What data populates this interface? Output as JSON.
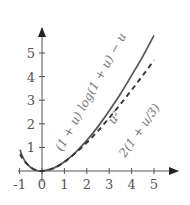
{
  "chart_data": {
    "type": "line",
    "title": "",
    "xlabel": "",
    "ylabel": "",
    "xlim": [
      -1,
      5.6
    ],
    "ylim": [
      0,
      5.9
    ],
    "grid": false,
    "legend": "none (curves labeled inline)",
    "x_ticks": [
      -1,
      0,
      1,
      2,
      3,
      4,
      5
    ],
    "x_tick_labels": [
      "-1",
      "0",
      "1",
      "2",
      "3",
      "4",
      "5"
    ],
    "y_ticks": [
      1,
      2,
      3,
      4,
      5
    ],
    "y_tick_labels": [
      "1",
      "2",
      "3",
      "4",
      "5"
    ],
    "series": [
      {
        "name": "(1 + u) log(1 + u) − u",
        "style": "solid",
        "color": "#555555",
        "x": [
          -0.98,
          -0.9,
          -0.75,
          -0.5,
          -0.25,
          0,
          0.5,
          1,
          1.5,
          2,
          2.5,
          3,
          3.5,
          4,
          4.5,
          5
        ],
        "y": [
          0.9,
          0.67,
          0.4,
          0.15,
          0.03,
          0,
          0.11,
          0.39,
          0.79,
          1.3,
          1.88,
          2.55,
          3.26,
          4.05,
          4.86,
          5.75
        ]
      },
      {
        "name": "u² / 2(1 + u/3)",
        "style": "dashed",
        "color": "#333333",
        "x": [
          -0.98,
          -0.9,
          -0.75,
          -0.5,
          -0.25,
          0,
          0.5,
          1,
          1.5,
          2,
          2.5,
          3,
          3.5,
          4,
          4.5,
          5
        ],
        "y": [
          0.71,
          0.58,
          0.38,
          0.15,
          0.03,
          0,
          0.11,
          0.38,
          0.77,
          1.2,
          1.7,
          2.25,
          2.83,
          3.43,
          4.05,
          4.69
        ]
      }
    ],
    "annotations": [
      {
        "text": "(1 + u) log(1 + u) − u",
        "rotation_deg": -62,
        "near": [
          2.2,
          3.5
        ]
      },
      {
        "text": "u²",
        "role": "numerator",
        "rotation_deg": -55,
        "near": [
          3.2,
          1.9
        ]
      },
      {
        "text": "2(1 + u/3)",
        "role": "denominator",
        "rotation_deg": -55,
        "near": [
          3.7,
          1.2
        ]
      }
    ]
  },
  "labels": {
    "solid_curve": "(1 + u) log(1 + u) − u",
    "dashed_numerator": "u²",
    "dashed_denominator": "2(1 + u/3)"
  },
  "colors": {
    "axis": "#555555",
    "solid_curve": "#555555",
    "dashed_curve": "#333333",
    "text": "#666666",
    "background": "#ffffff"
  }
}
